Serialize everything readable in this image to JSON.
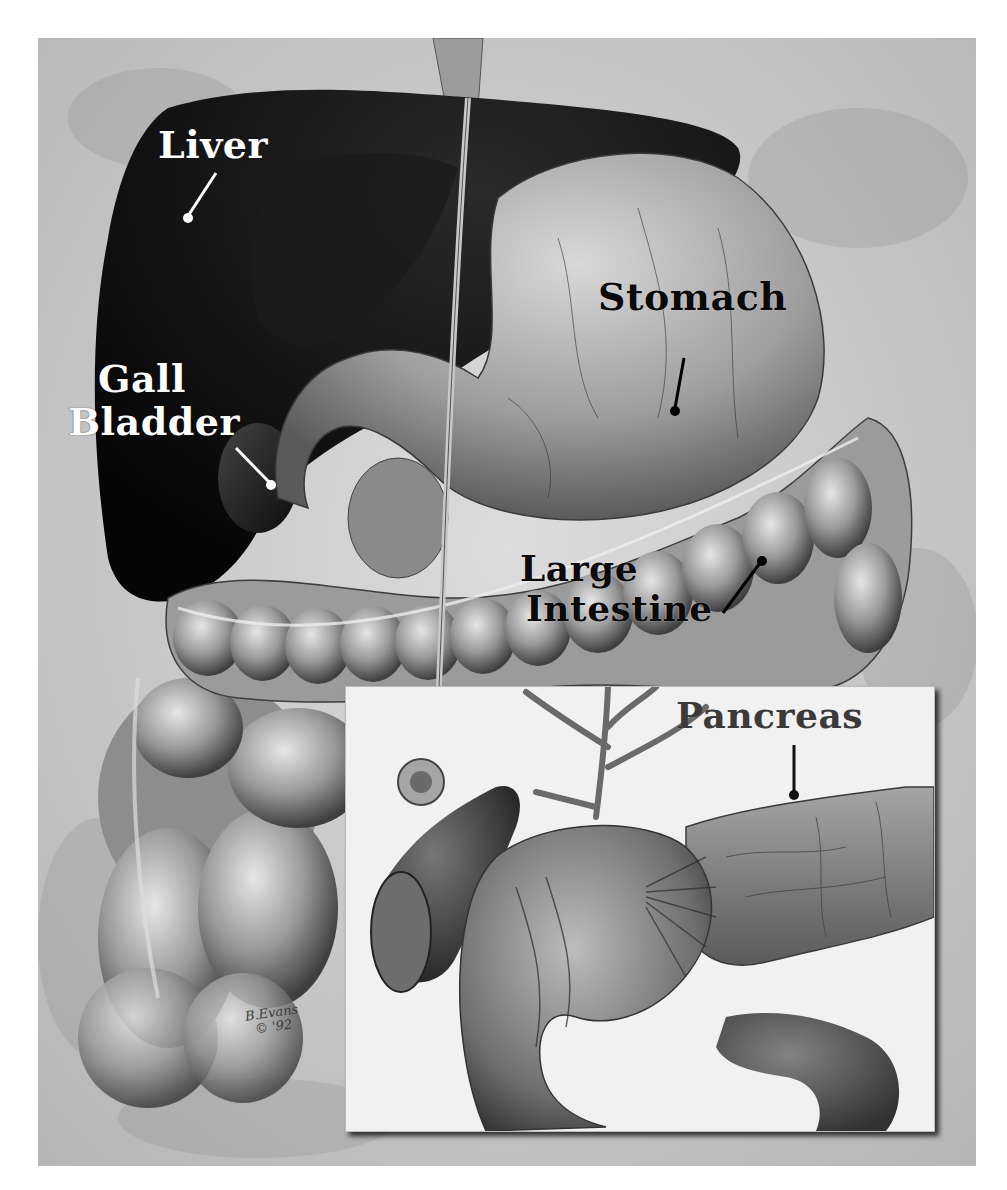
{
  "figure": {
    "style": "grayscale medical illustration"
  },
  "labels": {
    "liver": "Liver",
    "gall_bladder_line1": "Gall",
    "gall_bladder_line2": "Bladder",
    "stomach": "Stomach",
    "large_intestine_line1": "Large",
    "large_intestine_line2": "Intestine",
    "pancreas": "Pancreas"
  },
  "signature": {
    "name": "B.Evans",
    "year": "© '92"
  },
  "colors": {
    "background": "#c9c9c9",
    "liver": "#111111",
    "stomach": "#9a9a9a",
    "intestine": "#a8a8a8",
    "inset_bg": "#f1f1f1",
    "pancreas": "#7a7a7a"
  }
}
